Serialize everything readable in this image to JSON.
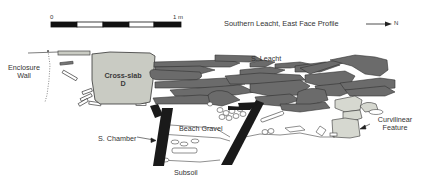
{
  "title": "Southern Leacht, East Face Profile",
  "north_arrow": {
    "label": "N"
  },
  "scale_bar": {
    "start_label": "0",
    "end_label": "1 m",
    "segments": 5
  },
  "labels": {
    "enclosure_wall_line1": "Enclosure",
    "enclosure_wall_line2": "Wall",
    "cross_slab_line1": "Cross-slab",
    "cross_slab_line2": "D",
    "s_leacht": "S. Leacht",
    "s_chamber": "S. Chamber",
    "beach_gravel": "Beach Gravel",
    "subsoil": "Subsoil",
    "curvilinear_line1": "Curvilinear",
    "curvilinear_line2": "Feature"
  },
  "colors": {
    "stone_dark": "#6b6b6b",
    "stone_light": "#d6d8d0",
    "cross_slab": "#c9cbc3",
    "outline": "#333333",
    "chamber_slab": "#1a1a1a"
  }
}
